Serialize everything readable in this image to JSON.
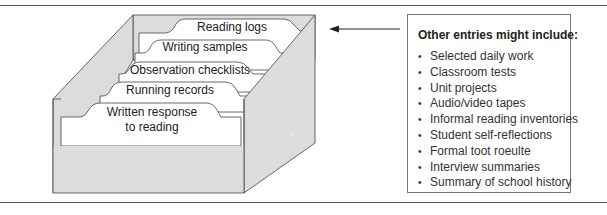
{
  "figure": {
    "file_box": {
      "dividers": [
        {
          "label": "Reading logs"
        },
        {
          "label": "Writing samples"
        },
        {
          "label": "Observation checklists"
        },
        {
          "label": "Running records"
        },
        {
          "label_line1": "Written response",
          "label_line2": "to reading"
        }
      ]
    },
    "arrow": {
      "direction": "left"
    },
    "entries_box": {
      "title": "Other entries might include:",
      "bullet_glyph": "•",
      "items": [
        "Selected daily work",
        "Classroom tests",
        "Unit projects",
        "Audio/video tapes",
        "Informal reading inventories",
        "Student self-reflections",
        "Formal toot roeulte",
        "Interview summaries",
        "Summary of school history"
      ]
    }
  },
  "colors": {
    "box_fill": "#dcdcdc",
    "card_fill": "#ffffff",
    "line": "#444444",
    "rule": "#555555"
  }
}
